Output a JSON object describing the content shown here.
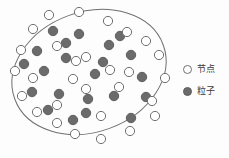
{
  "figure": {
    "title": "",
    "background_color": "#fdfdfd",
    "width": 229,
    "height": 158
  },
  "colors": {
    "boundary_stroke": "#6f6f6f",
    "node_fill": "#ffffff",
    "node_stroke": "#6f6f6f",
    "particle_fill": "#6b6b6b",
    "particle_stroke": "#5e5e5e",
    "text": "#3a3a3a"
  },
  "legend": {
    "position": "right",
    "entries": [
      {
        "symbol": "open-circle",
        "label": "节点",
        "fill": "#ffffff",
        "stroke": "#6f6f6f"
      },
      {
        "symbol": "filled-circle",
        "label": "粒子",
        "fill": "#6b6b6b",
        "stroke": "#5e5e5e"
      }
    ]
  },
  "chart_data": {
    "type": "scatter",
    "title": "",
    "xlabel": "",
    "ylabel": "",
    "grid": false,
    "legend_position": "right",
    "boundary": {
      "shape": "ellipse",
      "center_x": 89,
      "center_y": 72,
      "radius_x": 79,
      "radius_y": 60,
      "rotation_deg": -20,
      "stroke": "#6f6f6f",
      "stroke_width": 1
    },
    "series": [
      {
        "name": "节点",
        "marker": "open-circle",
        "radius": 4.6,
        "on_boundary": true,
        "count": 18,
        "points": [
          [
            49,
            15
          ],
          [
            79,
            12
          ],
          [
            108,
            21
          ],
          [
            127,
            32
          ],
          [
            146,
            41
          ],
          [
            159,
            55
          ],
          [
            165,
            78
          ],
          [
            152,
            101
          ],
          [
            155,
            116
          ],
          [
            130,
            131
          ],
          [
            101,
            139
          ],
          [
            75,
            134
          ],
          [
            57,
            123
          ],
          [
            37,
            112
          ],
          [
            22,
            96
          ],
          [
            15,
            71
          ],
          [
            21,
            50
          ],
          [
            33,
            29
          ]
        ]
      },
      {
        "name": "粒子",
        "marker": "filled-circle",
        "radius": 4.7,
        "on_boundary": false,
        "count": 22,
        "points": [
          [
            53,
            31
          ],
          [
            79,
            34
          ],
          [
            37,
            51
          ],
          [
            66,
            43
          ],
          [
            109,
            45
          ],
          [
            131,
            55
          ],
          [
            44,
            71
          ],
          [
            66,
            58
          ],
          [
            95,
            74
          ],
          [
            142,
            77
          ],
          [
            32,
            92
          ],
          [
            59,
            94
          ],
          [
            88,
            99
          ],
          [
            114,
            96
          ],
          [
            146,
            97
          ],
          [
            86,
            113
          ],
          [
            131,
            118
          ],
          [
            48,
            110
          ],
          [
            103,
            62
          ],
          [
            24,
            64
          ],
          [
            73,
            120
          ],
          [
            120,
            36
          ]
        ]
      },
      {
        "name": "内部节点",
        "marker": "open-circle",
        "radius": 4.6,
        "on_boundary": false,
        "count": 11,
        "points": [
          [
            57,
            46
          ],
          [
            86,
            57
          ],
          [
            110,
            70
          ],
          [
            73,
            79
          ],
          [
            33,
            78
          ],
          [
            86,
            89
          ],
          [
            119,
            87
          ],
          [
            57,
            105
          ],
          [
            101,
            116
          ],
          [
            129,
            72
          ],
          [
            76,
            61
          ]
        ]
      }
    ]
  }
}
